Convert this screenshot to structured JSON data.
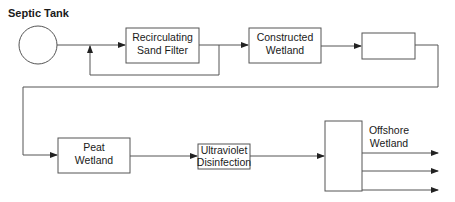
{
  "diagram": {
    "title": "Septic Tank",
    "nodes": [
      {
        "id": "septic-tank",
        "shape": "circle",
        "label": "Septic Tank"
      },
      {
        "id": "recirculating-sand-filter",
        "shape": "box",
        "label_line1": "Recirculating",
        "label_line2": "Sand Filter"
      },
      {
        "id": "constructed-wetland",
        "shape": "box",
        "label_line1": "Constructed",
        "label_line2": "Wetland"
      },
      {
        "id": "unlabeled-box",
        "shape": "box",
        "label_line1": "",
        "label_line2": ""
      },
      {
        "id": "peat-wetland",
        "shape": "box",
        "label_line1": "Peat",
        "label_line2": "Wetland"
      },
      {
        "id": "ultraviolet-disinfection",
        "shape": "box",
        "label_line1": "Ultraviolet",
        "label_line2": "Disinfection"
      },
      {
        "id": "offshore-wetland",
        "shape": "box",
        "label_line1": "Offshore",
        "label_line2": "Wetland"
      }
    ],
    "edges": [
      {
        "from": "septic-tank",
        "to": "recirculating-sand-filter"
      },
      {
        "from": "recirculating-sand-filter",
        "to": "recirculating-sand-filter",
        "note": "recirculation loop"
      },
      {
        "from": "recirculating-sand-filter",
        "to": "constructed-wetland"
      },
      {
        "from": "constructed-wetland",
        "to": "unlabeled-box"
      },
      {
        "from": "unlabeled-box",
        "to": "peat-wetland"
      },
      {
        "from": "peat-wetland",
        "to": "ultraviolet-disinfection"
      },
      {
        "from": "ultraviolet-disinfection",
        "to": "offshore-wetland"
      },
      {
        "from": "offshore-wetland",
        "to": "outflow",
        "count": 3
      }
    ],
    "colors": {
      "line": "#555555",
      "text": "#1a1a1a",
      "background": "#ffffff"
    }
  }
}
